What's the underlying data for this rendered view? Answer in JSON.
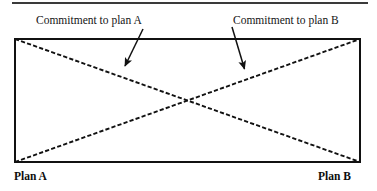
{
  "figure": {
    "type": "diagram",
    "background_color": "#ffffff",
    "line_color": "#111111",
    "frame": {
      "x": 14,
      "y": 38,
      "width": 347,
      "height": 125,
      "border_width_px": 2
    },
    "top_rule_artifact": {
      "x": 12,
      "y": 2,
      "width": 356,
      "height": 2,
      "color": "#3a3a3a"
    },
    "annotations": {
      "commitment_a_label": "Commitment to plan A",
      "commitment_b_label": "Commitment to plan B"
    },
    "endpoints": {
      "left_label": "Plan A",
      "right_label": "Plan B"
    },
    "lines": [
      {
        "name": "commitment-to-plan-a-line",
        "style": "dashed",
        "from": {
          "x": 15,
          "y": 39
        },
        "to": {
          "x": 360,
          "y": 162
        },
        "meaning": "Commitment to plan A declines from left to right"
      },
      {
        "name": "commitment-to-plan-b-line",
        "style": "dashed",
        "from": {
          "x": 15,
          "y": 162
        },
        "to": {
          "x": 360,
          "y": 39
        },
        "meaning": "Commitment to plan B rises from left to right"
      }
    ],
    "crossing_point": {
      "x": 188,
      "y": 100
    },
    "arrows": [
      {
        "name": "arrow-to-plan-a-line",
        "from": {
          "x": 143,
          "y": 29
        },
        "to": {
          "x": 124,
          "y": 68
        }
      },
      {
        "name": "arrow-to-plan-b-line",
        "from": {
          "x": 232,
          "y": 27
        },
        "to": {
          "x": 245,
          "y": 71
        }
      }
    ]
  }
}
